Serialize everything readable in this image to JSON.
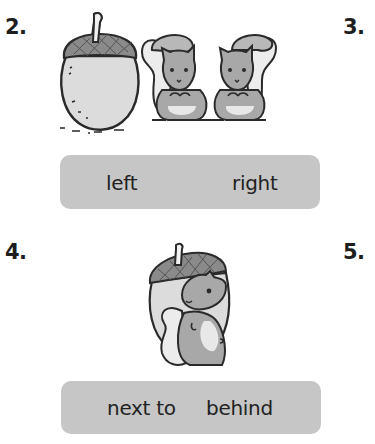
{
  "exercises": [
    {
      "number": "2.",
      "illustration": "acorn-next-to-two-squirrels",
      "choices": [
        "left",
        "right"
      ]
    },
    {
      "number": "3."
    },
    {
      "number": "4.",
      "illustration": "squirrel-in-front-of-acorn",
      "choices": [
        "next to",
        "behind"
      ]
    },
    {
      "number": "5."
    }
  ],
  "colors": {
    "choice_box": "#c6c6c6",
    "outline": "#2a2a2a",
    "acorn_body": "#dcdcdc",
    "acorn_cap": "#8a8a8a",
    "squirrel_fur": "#a8a8a8",
    "squirrel_belly": "#e8e8e8"
  }
}
